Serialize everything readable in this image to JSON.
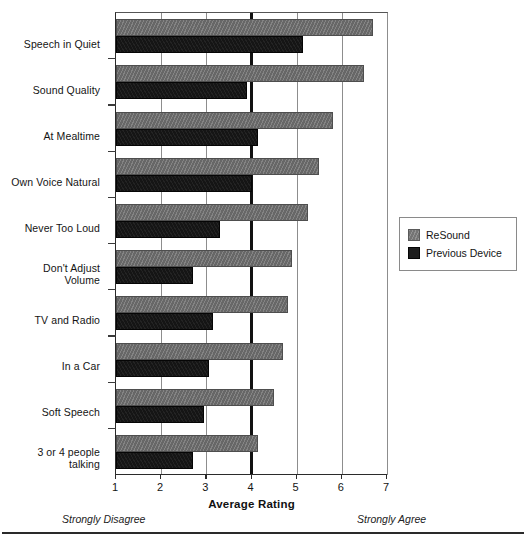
{
  "chart_data": {
    "type": "bar",
    "orientation": "horizontal",
    "title": "",
    "xlabel": "Average Rating",
    "ylabel": "",
    "xlim": [
      1,
      7
    ],
    "xticks": [
      1,
      2,
      3,
      4,
      5,
      6,
      7
    ],
    "xtick_labels": [
      "1",
      "2",
      "3",
      "4",
      "5",
      "6",
      "7"
    ],
    "grid": true,
    "grid_axis": "x",
    "emphasized_gridline": 4,
    "legend_position": "right",
    "categories": [
      "Speech in Quiet",
      "Sound Quality",
      "At Mealtime",
      "Own Voice Natural",
      "Never Too Loud",
      "Don't  Adjust\nVolume",
      "TV and Radio",
      "In a Car",
      "Soft Speech",
      "3 or 4 people\ntalking"
    ],
    "series": [
      {
        "name": "ReSound",
        "color": "#6d6d6d",
        "values": [
          6.7,
          6.5,
          5.8,
          5.5,
          5.25,
          4.9,
          4.8,
          4.7,
          4.5,
          4.15
        ]
      },
      {
        "name": "Previous Device",
        "color": "#171717",
        "values": [
          5.15,
          3.9,
          4.15,
          4.0,
          3.3,
          2.7,
          3.15,
          3.05,
          2.95,
          2.7
        ]
      }
    ],
    "annotations": {
      "scale_low": "Strongly Disagree",
      "scale_high": "Strongly Agree"
    }
  },
  "legend": {
    "items": [
      {
        "label": "ReSound",
        "swatch": "gray-swatch-icon"
      },
      {
        "label": "Previous Device",
        "swatch": "black-swatch-icon"
      }
    ]
  }
}
